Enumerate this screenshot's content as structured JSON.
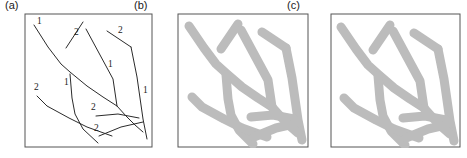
{
  "figure": {
    "caption_a": "(a)",
    "caption_b": "(b)",
    "caption_c": "(c)",
    "colors": {
      "frame_stroke": "#555555",
      "thin_line": "#2b2b2b",
      "thick_line": "#bcbcbc",
      "background": "#ffffff",
      "label_text": "#1a1a1a"
    }
  },
  "chart_data": {
    "type": "line",
    "title": "",
    "xlabel": "",
    "ylabel": "",
    "grid": false,
    "legend": "none",
    "panels": [
      {
        "key": "a",
        "label": "(a)",
        "style": "thin-polyline-with-numeric-labels",
        "frame": {
          "x": 25,
          "y": 14,
          "w": 127,
          "h": 133
        },
        "viewbox": "0 0 127 133",
        "polylines": [
          {
            "id": "a1",
            "points": "9,11 23,33 36,50 45,58 62,72 78,83 92,92"
          },
          {
            "id": "a2",
            "points": "41,34 58,8"
          },
          {
            "id": "a3",
            "points": "61,15 88,65 92,92"
          },
          {
            "id": "a4",
            "points": "82,17 106,33"
          },
          {
            "id": "a5",
            "points": "106,33 112,63 118,105 122,125"
          },
          {
            "id": "a6",
            "points": "45,60 47,84 50,100 58,115 73,129"
          },
          {
            "id": "a7",
            "points": "12,82 22,92 44,104 62,113 87,122"
          },
          {
            "id": "a8",
            "points": "71,102 93,100 114,104"
          },
          {
            "id": "a9",
            "points": "74,122 96,113 118,108"
          },
          {
            "id": "a10",
            "points": "92,92 101,102 110,111 118,118"
          }
        ],
        "numeric_labels": [
          {
            "text": "1",
            "x": 12,
            "y": 10
          },
          {
            "text": "2",
            "x": 49,
            "y": 21
          },
          {
            "text": "2",
            "x": 93,
            "y": 19
          },
          {
            "text": "1",
            "x": 83,
            "y": 53
          },
          {
            "text": "1",
            "x": 118,
            "y": 79
          },
          {
            "text": "1",
            "x": 39,
            "y": 71
          },
          {
            "text": "2",
            "x": 9,
            "y": 76
          },
          {
            "text": "2",
            "x": 66,
            "y": 96
          },
          {
            "text": "2",
            "x": 69,
            "y": 117
          }
        ]
      },
      {
        "key": "b",
        "label": "(b)",
        "style": "thick-gray-strokes",
        "frame": {
          "x": 178,
          "y": 14,
          "w": 130,
          "h": 133
        },
        "viewbox": "0 0 130 133",
        "polylines": [
          {
            "id": "b1",
            "points": "11,12 26,34 38,50 48,59 64,73 80,84 94,93"
          },
          {
            "id": "b2",
            "points": "43,35 60,10"
          },
          {
            "id": "b3",
            "points": "63,16 90,66 94,93"
          },
          {
            "id": "b4",
            "points": "84,18 108,34"
          },
          {
            "id": "b5",
            "points": "108,34 114,64 120,106 124,126"
          },
          {
            "id": "b6",
            "points": "48,61 50,85 53,101 61,116 75,130"
          },
          {
            "id": "b7",
            "points": "14,83 24,93 46,105 64,114 89,123"
          },
          {
            "id": "b8",
            "points": "73,103 95,101 116,105"
          },
          {
            "id": "b9",
            "points": "76,123 98,114 120,109"
          },
          {
            "id": "b10",
            "points": "94,93 103,103 112,112 120,119"
          }
        ],
        "numeric_labels": []
      },
      {
        "key": "c",
        "label": "(c)",
        "style": "thick-gray-strokes",
        "frame": {
          "x": 331,
          "y": 14,
          "w": 129,
          "h": 133
        },
        "viewbox": "0 0 129 133",
        "polylines": [
          {
            "id": "c1",
            "points": "10,13 25,35 37,51 47,60 63,74 79,85 93,94"
          },
          {
            "id": "c2",
            "points": "42,36 59,11"
          },
          {
            "id": "c3",
            "points": "62,17 89,67 93,94"
          },
          {
            "id": "c4",
            "points": "83,19 107,35"
          },
          {
            "id": "c5",
            "points": "107,35 113,65 119,107 123,127"
          },
          {
            "id": "c6",
            "points": "47,62 49,86 52,102 60,117 74,131"
          },
          {
            "id": "c7",
            "points": "13,84 23,94 45,106 63,115 88,124"
          },
          {
            "id": "c8",
            "points": "72,104 94,102 115,106"
          },
          {
            "id": "c9",
            "points": "75,124 97,115 119,110"
          },
          {
            "id": "c10",
            "points": "93,94 102,104 111,113 119,120"
          }
        ],
        "numeric_labels": []
      }
    ]
  }
}
